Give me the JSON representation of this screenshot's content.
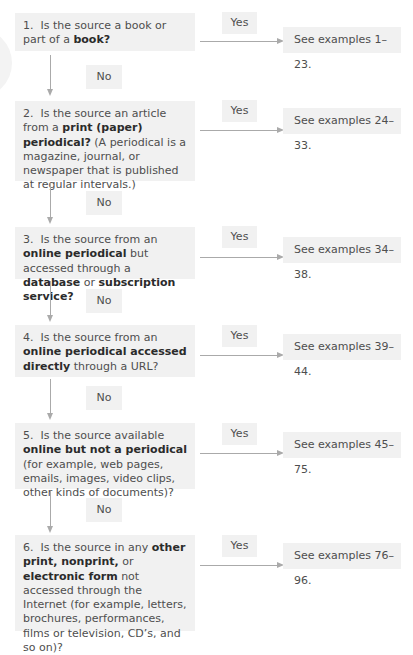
{
  "flowchart": {
    "title": "",
    "connectors": {
      "yes_label": "Yes",
      "no_label": "No"
    },
    "steps": [
      {
        "number": "1.",
        "parts": [
          {
            "text": "Is the source a book or part of a ",
            "bold": false
          },
          {
            "text": "book?",
            "bold": true
          }
        ],
        "yes": "Yes",
        "result": "See examples 1–23.",
        "no": "No"
      },
      {
        "number": "2.",
        "parts": [
          {
            "text": "Is the source an article from a ",
            "bold": false
          },
          {
            "text": "print (paper) periodical?",
            "bold": true
          },
          {
            "text": " (A periodical is a magazine, journal, or newspaper that is published at regular intervals.)",
            "bold": false
          }
        ],
        "yes": "Yes",
        "result": "See examples 24–33.",
        "no": "No"
      },
      {
        "number": "3.",
        "parts": [
          {
            "text": "Is the source from an ",
            "bold": false
          },
          {
            "text": "online periodical",
            "bold": true
          },
          {
            "text": " but accessed through a ",
            "bold": false
          },
          {
            "text": "database",
            "bold": true
          },
          {
            "text": " or ",
            "bold": false
          },
          {
            "text": "subscription service?",
            "bold": true
          }
        ],
        "yes": "Yes",
        "result": "See examples 34–38.",
        "no": "No"
      },
      {
        "number": "4.",
        "parts": [
          {
            "text": "Is the source from an ",
            "bold": false
          },
          {
            "text": "online periodical accessed directly",
            "bold": true
          },
          {
            "text": " through a URL?",
            "bold": false
          }
        ],
        "yes": "Yes",
        "result": "See examples 39–44.",
        "no": "No"
      },
      {
        "number": "5.",
        "parts": [
          {
            "text": "Is the source available ",
            "bold": false
          },
          {
            "text": "online but not a periodical",
            "bold": true
          },
          {
            "text": " (for example, web pages, emails, images, video clips, other kinds of documents)?",
            "bold": false
          }
        ],
        "yes": "Yes",
        "result": "See examples 45–75.",
        "no": "No"
      },
      {
        "number": "6.",
        "parts": [
          {
            "text": "Is the source in any ",
            "bold": false
          },
          {
            "text": "other print, nonprint,",
            "bold": true
          },
          {
            "text": " or ",
            "bold": false
          },
          {
            "text": "electronic form",
            "bold": true
          },
          {
            "text": " not accessed through the Internet (for example, letters, brochures, performances, films or television, CD’s, and so on)?",
            "bold": false
          }
        ],
        "yes": "Yes",
        "result": "See examples 76–96.",
        "no": null
      }
    ]
  },
  "colors": {
    "box_fill": "#f1f1f1",
    "arrow": "#aaaaaa",
    "text": "#4e4e4e",
    "bold_text": "#2b2b2b"
  }
}
